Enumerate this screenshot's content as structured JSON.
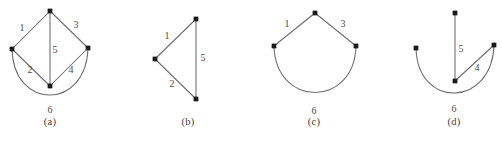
{
  "figure": {
    "background_color": "#ffffff",
    "edge_color": "#6b6b6b",
    "vertex_color": "#1a1a1a",
    "label_color": "#4a4a4a",
    "caption_color": "#3d3d3d",
    "subfigures": [
      {
        "id": "a",
        "caption": "(a)",
        "caption_x": 50,
        "caption_y": 123,
        "vertices": [
          {
            "name": "top",
            "x": 50,
            "y": 11
          },
          {
            "name": "left",
            "x": 12,
            "y": 49
          },
          {
            "name": "right",
            "x": 88,
            "y": 48
          },
          {
            "name": "bottom",
            "x": 50,
            "y": 86
          }
        ],
        "edges": [
          {
            "label": "1",
            "type": "line",
            "from": "left",
            "to": "top",
            "label_x": 22,
            "label_y": 29
          },
          {
            "label": "3",
            "type": "line",
            "from": "top",
            "to": "right",
            "label_x": 76,
            "label_y": 26
          },
          {
            "label": "5",
            "type": "line",
            "from": "top",
            "to": "bottom",
            "label_x": 55,
            "label_y": 51
          },
          {
            "label": "2",
            "type": "line",
            "from": "left",
            "to": "bottom",
            "label_x": 30,
            "label_y": 71
          },
          {
            "label": "4",
            "type": "line",
            "from": "bottom",
            "to": "right",
            "label_x": 71,
            "label_y": 71
          },
          {
            "label": "6",
            "type": "curve",
            "from": "left",
            "to": "right",
            "label_x": 50,
            "label_y": 111
          }
        ]
      },
      {
        "id": "b",
        "caption": "(b)",
        "caption_x": 188,
        "caption_y": 123,
        "vertices": [
          {
            "name": "top",
            "x": 196,
            "y": 19
          },
          {
            "name": "left",
            "x": 155,
            "y": 59
          },
          {
            "name": "bottom",
            "x": 196,
            "y": 99
          }
        ],
        "edges": [
          {
            "label": "1",
            "type": "line",
            "from": "left",
            "to": "top",
            "label_x": 167,
            "label_y": 37
          },
          {
            "label": "2",
            "type": "line",
            "from": "left",
            "to": "bottom",
            "label_x": 172,
            "label_y": 85
          },
          {
            "label": "5",
            "type": "line",
            "from": "top",
            "to": "bottom",
            "label_x": 203,
            "label_y": 59
          }
        ]
      },
      {
        "id": "c",
        "caption": "(c)",
        "caption_x": 314,
        "caption_y": 123,
        "vertices": [
          {
            "name": "top",
            "x": 315,
            "y": 13
          },
          {
            "name": "left",
            "x": 274,
            "y": 46
          },
          {
            "name": "right",
            "x": 356,
            "y": 46
          }
        ],
        "edges": [
          {
            "label": "1",
            "type": "line",
            "from": "left",
            "to": "top",
            "label_x": 287,
            "label_y": 25
          },
          {
            "label": "3",
            "type": "line",
            "from": "top",
            "to": "right",
            "label_x": 343,
            "label_y": 25
          },
          {
            "label": "6",
            "type": "curve",
            "from": "left",
            "to": "right",
            "label_x": 314,
            "label_y": 112
          }
        ]
      },
      {
        "id": "d",
        "caption": "(d)",
        "caption_x": 454,
        "caption_y": 123,
        "vertices": [
          {
            "name": "top",
            "x": 455,
            "y": 13
          },
          {
            "name": "left",
            "x": 416,
            "y": 48
          },
          {
            "name": "right",
            "x": 494,
            "y": 45
          },
          {
            "name": "center",
            "x": 455,
            "y": 81
          }
        ],
        "edges": [
          {
            "label": "5",
            "type": "line",
            "from": "top",
            "to": "center",
            "label_x": 461,
            "label_y": 50
          },
          {
            "label": "4",
            "type": "line",
            "from": "center",
            "to": "right",
            "label_x": 477,
            "label_y": 69
          },
          {
            "label": "6",
            "type": "curve",
            "from": "left",
            "to": "right",
            "label_x": 454,
            "label_y": 110
          }
        ]
      }
    ]
  }
}
